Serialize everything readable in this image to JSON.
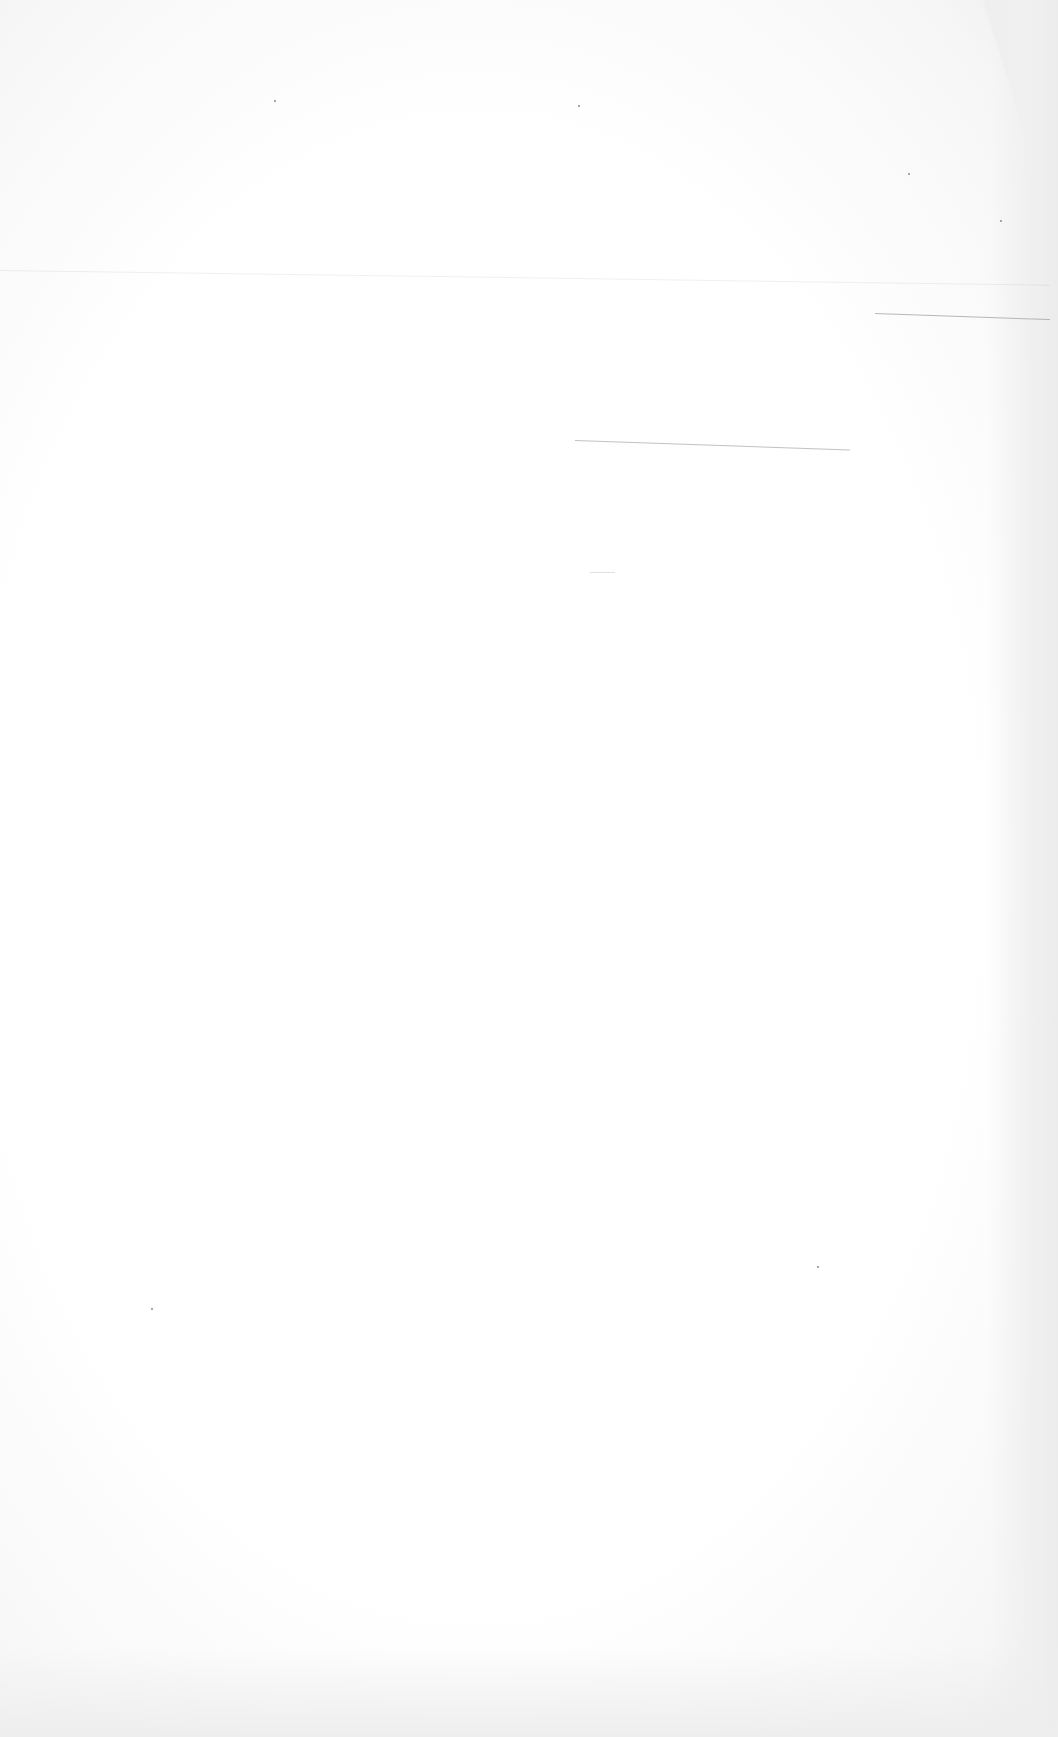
{
  "document": {
    "type": "blank scanned page",
    "text_content": "",
    "colors": {
      "paper": "#ffffff",
      "edge_shadow": "#ececec",
      "rule_line": "#9a9a9a"
    },
    "marks": {
      "rule_lines": [
        {
          "x": 0,
          "y": 270,
          "length": 1050,
          "angle": 0.8,
          "opacity": 0.15
        },
        {
          "x": 875,
          "y": 313,
          "length": 175,
          "angle": 2.0,
          "opacity": 0.7
        },
        {
          "x": 575,
          "y": 440,
          "length": 275,
          "angle": 2.0,
          "opacity": 0.6
        },
        {
          "x": 590,
          "y": 572,
          "length": 25,
          "angle": 0,
          "opacity": 0.3
        }
      ],
      "specks": [
        {
          "x": 908,
          "y": 173
        },
        {
          "x": 274,
          "y": 100
        },
        {
          "x": 578,
          "y": 105
        },
        {
          "x": 1000,
          "y": 220
        },
        {
          "x": 151,
          "y": 1308
        },
        {
          "x": 817,
          "y": 1266
        }
      ]
    }
  }
}
